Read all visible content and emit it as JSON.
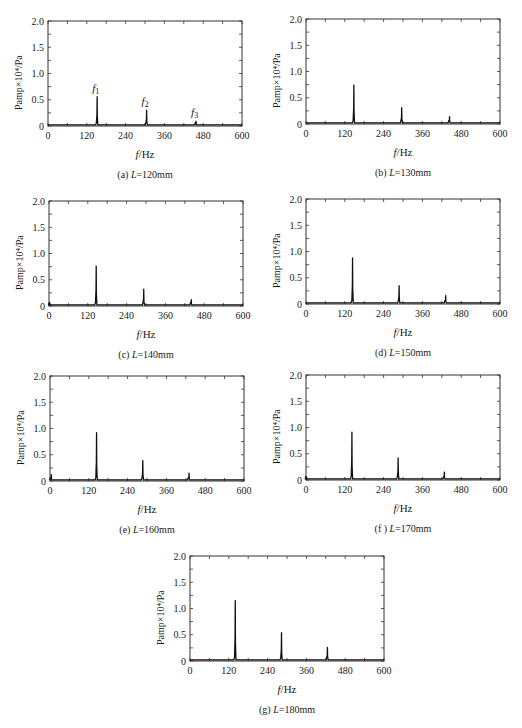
{
  "figure": {
    "ylabel": "Pamp×10⁴/Pa",
    "xlabel_var": "f",
    "xlabel_unit": "/Hz"
  },
  "chart_data": [
    {
      "type": "line",
      "id": "a",
      "caption_prefix": "(a) ",
      "caption_var": "L",
      "caption_value": "=120mm",
      "xlabel": "f/Hz",
      "ylabel": "Pamp×10⁴/Pa",
      "xlim": [
        0,
        600
      ],
      "ylim": [
        0,
        2.0
      ],
      "xticks": [
        0,
        120,
        240,
        360,
        480,
        600
      ],
      "yticks": [
        "0",
        "0.5",
        "1.0",
        "1.5",
        "2.0"
      ],
      "baseline": 0.02,
      "peaks": [
        {
          "x": 152,
          "y": 0.56,
          "label": "f",
          "sub": "1"
        },
        {
          "x": 305,
          "y": 0.3,
          "label": "f",
          "sub": "2"
        },
        {
          "x": 458,
          "y": 0.09,
          "label": "f",
          "sub": "3"
        }
      ]
    },
    {
      "type": "line",
      "id": "b",
      "caption_prefix": "(b) ",
      "caption_var": "L",
      "caption_value": "=130mm",
      "xlabel": "f/Hz",
      "ylabel": "Pamp×10⁴/Pa",
      "xlim": [
        0,
        600
      ],
      "ylim": [
        0,
        2.0
      ],
      "xticks": [
        0,
        120,
        240,
        360,
        480,
        600
      ],
      "yticks": [
        "0",
        "0.5",
        "1.0",
        "1.5",
        "2.0"
      ],
      "baseline": 0.02,
      "peaks": [
        {
          "x": 148,
          "y": 0.74
        },
        {
          "x": 296,
          "y": 0.31
        },
        {
          "x": 444,
          "y": 0.14
        }
      ]
    },
    {
      "type": "line",
      "id": "c",
      "caption_prefix": "(c) ",
      "caption_var": "L",
      "caption_value": "=140mm",
      "xlabel": "f/Hz",
      "ylabel": "Pamp×10⁴/Pa",
      "xlim": [
        0,
        600
      ],
      "ylim": [
        0,
        2.0
      ],
      "xticks": [
        0,
        120,
        240,
        360,
        480,
        600
      ],
      "yticks": [
        "0",
        "0.5",
        "1.0",
        "1.5",
        "2.0"
      ],
      "baseline": 0.02,
      "peaks": [
        {
          "x": 3,
          "y": 0.05
        },
        {
          "x": 146,
          "y": 0.76
        },
        {
          "x": 293,
          "y": 0.32
        },
        {
          "x": 440,
          "y": 0.12
        }
      ]
    },
    {
      "type": "line",
      "id": "d",
      "caption_prefix": "(d) ",
      "caption_var": "L",
      "caption_value": "=150mm",
      "xlabel": "f/Hz",
      "ylabel": "Pamp×10⁴/Pa",
      "xlim": [
        0,
        600
      ],
      "ylim": [
        0,
        2.0
      ],
      "xticks": [
        0,
        120,
        240,
        360,
        480,
        600
      ],
      "yticks": [
        "0",
        "0.5",
        "1.0",
        "1.5",
        "2.0"
      ],
      "baseline": 0.02,
      "peaks": [
        {
          "x": 144,
          "y": 0.88
        },
        {
          "x": 288,
          "y": 0.35
        },
        {
          "x": 432,
          "y": 0.16
        }
      ]
    },
    {
      "type": "line",
      "id": "e",
      "caption_prefix": "(e) ",
      "caption_var": "L",
      "caption_value": "=160mm",
      "xlabel": "f/Hz",
      "ylabel": "Pamp×10⁴/Pa",
      "xlim": [
        0,
        600
      ],
      "ylim": [
        0,
        2.0
      ],
      "xticks": [
        0,
        120,
        240,
        360,
        480,
        600
      ],
      "yticks": [
        "0",
        "0.5",
        "1.0",
        "1.5",
        "2.0"
      ],
      "baseline": 0.02,
      "peaks": [
        {
          "x": 4,
          "y": 0.12
        },
        {
          "x": 144,
          "y": 0.92
        },
        {
          "x": 287,
          "y": 0.39
        },
        {
          "x": 430,
          "y": 0.15
        }
      ]
    },
    {
      "type": "line",
      "id": "f",
      "caption_prefix": "(f ) ",
      "caption_var": "L",
      "caption_value": "=170mm",
      "xlabel": "f/Hz",
      "ylabel": "Pamp×10⁴/Pa",
      "xlim": [
        0,
        600
      ],
      "ylim": [
        0,
        2.0
      ],
      "xticks": [
        0,
        120,
        240,
        360,
        480,
        600
      ],
      "yticks": [
        "0",
        "0.5",
        "1.0",
        "1.5",
        "2.0"
      ],
      "baseline": 0.02,
      "peaks": [
        {
          "x": 2,
          "y": 0.05
        },
        {
          "x": 142,
          "y": 0.91
        },
        {
          "x": 285,
          "y": 0.42
        },
        {
          "x": 428,
          "y": 0.15
        }
      ]
    },
    {
      "type": "line",
      "id": "g",
      "caption_prefix": "(g) ",
      "caption_var": "L",
      "caption_value": "=180mm",
      "xlabel": "f/Hz",
      "ylabel": "Pamp×10⁴/Pa",
      "xlim": [
        0,
        600
      ],
      "ylim": [
        0,
        2.0
      ],
      "xticks": [
        0,
        120,
        240,
        360,
        480,
        600
      ],
      "yticks": [
        "0",
        "0.5",
        "1.0",
        "1.5",
        "2.0"
      ],
      "baseline": 0.02,
      "peaks": [
        {
          "x": 140,
          "y": 1.15
        },
        {
          "x": 283,
          "y": 0.54
        },
        {
          "x": 425,
          "y": 0.26
        }
      ]
    }
  ]
}
